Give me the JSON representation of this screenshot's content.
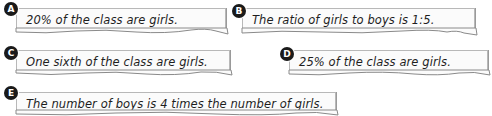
{
  "statements": [
    {
      "letter": "A",
      "text": "20% of the class are girls."
    },
    {
      "letter": "B",
      "text": "The ratio of girls to boys is 1:5."
    },
    {
      "letter": "C",
      "text": "One sixth of the class are girls."
    },
    {
      "letter": "D",
      "text": "25% of the class are girls."
    },
    {
      "letter": "E",
      "text": "The number of boys is 4 times the number of girls."
    }
  ]
}
